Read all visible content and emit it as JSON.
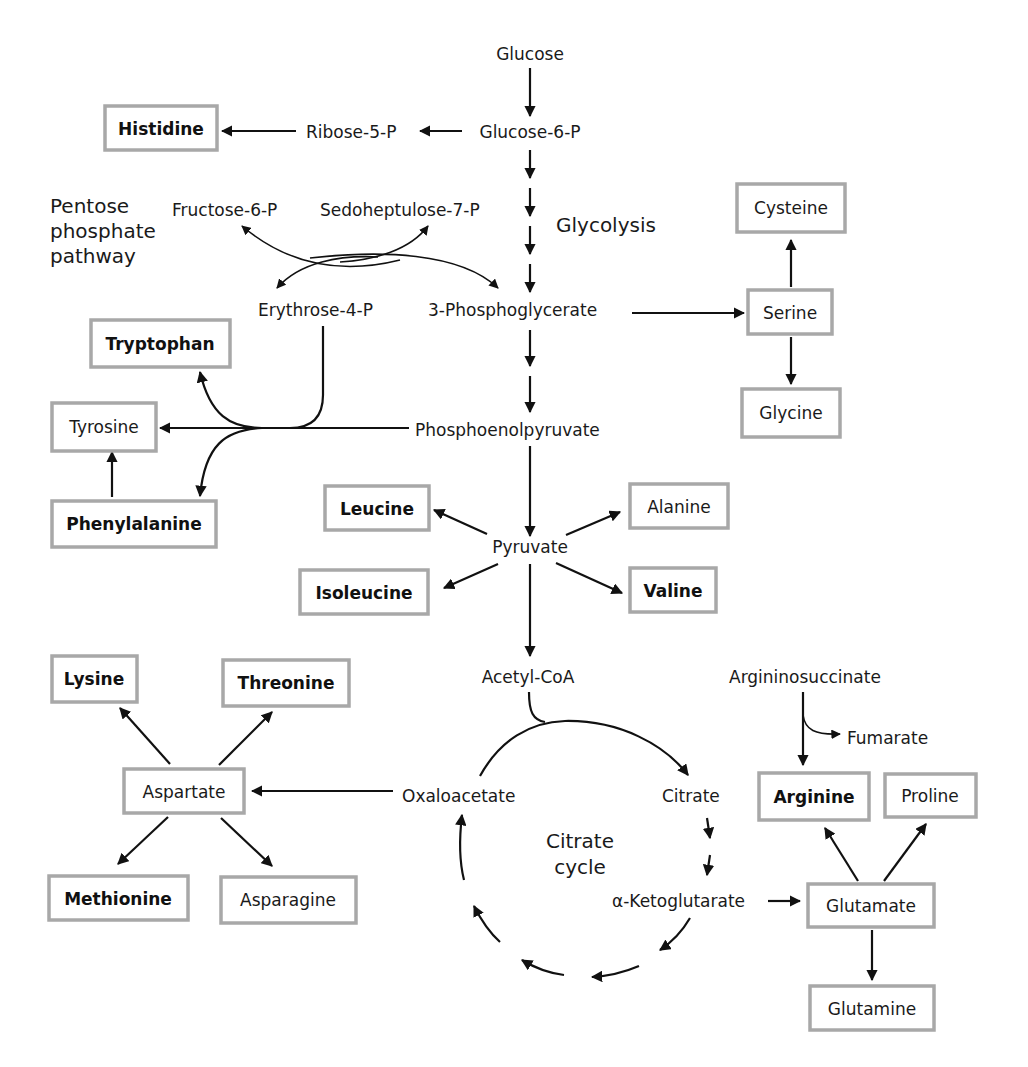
{
  "diagram": {
    "colors": {
      "line": "#111111",
      "box_border": "#a8a8a8",
      "text": "#1a1a1a",
      "background": "#ffffff"
    },
    "section_labels": {
      "ppp_line1": "Pentose",
      "ppp_line2": "phosphate",
      "ppp_line3": "pathway",
      "glycolysis": "Glycolysis",
      "cycle_line1": "Citrate",
      "cycle_line2": "cycle"
    },
    "metabolites": {
      "glucose": "Glucose",
      "glucose6p": "Glucose-6-P",
      "ribose5p": "Ribose-5-P",
      "fructose6p": "Fructose-6-P",
      "sedoheptulose7p": "Sedoheptulose-7-P",
      "erythrose4p": "Erythrose-4-P",
      "phosphoglycerate": "3-Phosphoglycerate",
      "pep": "Phosphoenolpyruvate",
      "pyruvate": "Pyruvate",
      "acetylcoa": "Acetyl-CoA",
      "oxaloacetate": "Oxaloacetate",
      "citrate": "Citrate",
      "ketoglutarate": "α-Ketoglutarate",
      "argininosuccinate": "Argininosuccinate",
      "fumarate": "Fumarate"
    },
    "amino_acids": {
      "histidine": {
        "label": "Histidine",
        "essential": true
      },
      "cysteine": {
        "label": "Cysteine",
        "essential": false
      },
      "serine": {
        "label": "Serine",
        "essential": false
      },
      "glycine": {
        "label": "Glycine",
        "essential": false
      },
      "tryptophan": {
        "label": "Tryptophan",
        "essential": true
      },
      "tyrosine": {
        "label": "Tyrosine",
        "essential": false
      },
      "phenylalanine": {
        "label": "Phenylalanine",
        "essential": true
      },
      "leucine": {
        "label": "Leucine",
        "essential": true
      },
      "isoleucine": {
        "label": "Isoleucine",
        "essential": true
      },
      "alanine": {
        "label": "Alanine",
        "essential": false
      },
      "valine": {
        "label": "Valine",
        "essential": true
      },
      "lysine": {
        "label": "Lysine",
        "essential": true
      },
      "threonine": {
        "label": "Threonine",
        "essential": true
      },
      "aspartate": {
        "label": "Aspartate",
        "essential": false
      },
      "methionine": {
        "label": "Methionine",
        "essential": true
      },
      "asparagine": {
        "label": "Asparagine",
        "essential": false
      },
      "arginine": {
        "label": "Arginine",
        "essential": true
      },
      "proline": {
        "label": "Proline",
        "essential": false
      },
      "glutamate": {
        "label": "Glutamate",
        "essential": false
      },
      "glutamine": {
        "label": "Glutamine",
        "essential": false
      }
    }
  }
}
